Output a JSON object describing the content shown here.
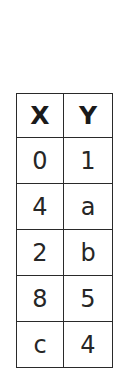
{
  "table": {
    "headers": [
      "X",
      "Y"
    ],
    "rows": [
      [
        "0",
        "1"
      ],
      [
        "4",
        "a"
      ],
      [
        "2",
        "b"
      ],
      [
        "8",
        "5"
      ],
      [
        "c",
        "4"
      ]
    ]
  },
  "colors": {
    "border": "#2a2a2a",
    "text": "#262626",
    "background": "#ffffff"
  }
}
